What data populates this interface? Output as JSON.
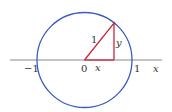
{
  "diagram": {
    "type": "unit-circle",
    "colors": {
      "circle": "#3a5bbf",
      "triangle": "#c8283c",
      "axis": "#8a8a8a",
      "text": "#333333"
    },
    "labels": {
      "neg_one": "−1",
      "origin": "0",
      "one": "1",
      "x_axis": "x",
      "hypotenuse": "1",
      "leg_y": "y",
      "leg_x": "x"
    }
  }
}
